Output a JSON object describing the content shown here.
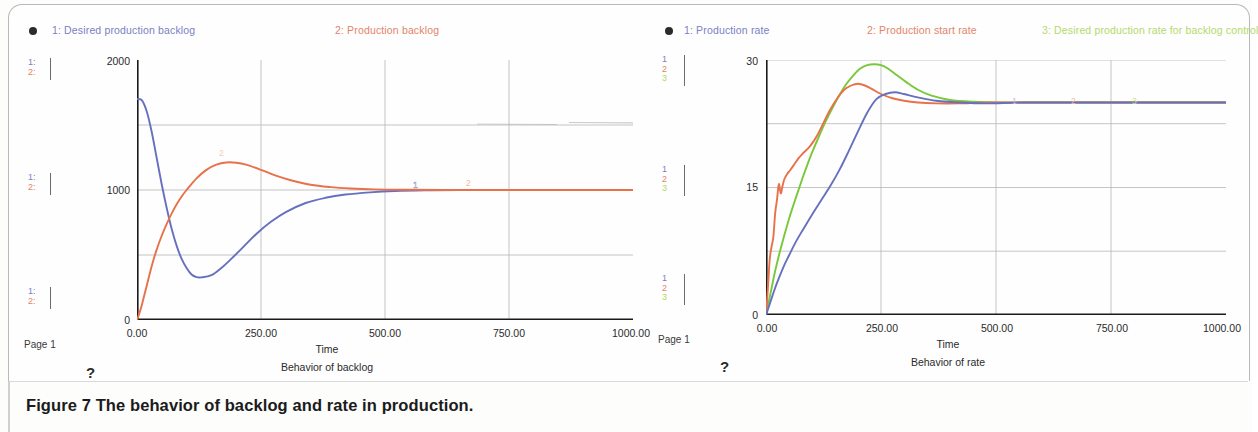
{
  "figure": {
    "caption": "Figure 7 The behavior of backlog and rate in production.",
    "page_label_left": "Page 1",
    "page_label_right": "Page 1",
    "help_glyph_left": "?",
    "help_glyph_right": "?"
  },
  "colors": {
    "series1_blue": "#6670c0",
    "series2_orange": "#e8714a",
    "series3_green": "#77c83a",
    "axis": "#1a1a1a",
    "grid": "#b6b6b6",
    "legend_blue": "#7b7fc4",
    "legend_orange": "#e2846a",
    "legend_green": "#b5d96a",
    "frame": "#b9b9b9"
  },
  "left_panel": {
    "legend": [
      {
        "id": "1",
        "label": "1: Desired production  backlog",
        "color_class": "lg-blue"
      },
      {
        "id": "2",
        "label": "2: Production backlog",
        "color_class": "lg-orange"
      }
    ],
    "scale_markers": [
      {
        "pos": "top",
        "rows": [
          "1:",
          "2:"
        ]
      },
      {
        "pos": "middle",
        "rows": [
          "1:",
          "2:"
        ]
      },
      {
        "pos": "bottom",
        "rows": [
          "1:",
          "2:"
        ]
      }
    ],
    "y_ticks": [
      "2000",
      "1000",
      "0"
    ],
    "x_ticks": [
      "0.00",
      "250.00",
      "500.00",
      "750.00",
      "1000.00"
    ],
    "x_axis_label": "Time",
    "title": "Behavior of backlog",
    "inline_labels": [
      "1",
      "2"
    ]
  },
  "right_panel": {
    "legend": [
      {
        "id": "1",
        "label": "1: Production rate",
        "color_class": "lg-blue"
      },
      {
        "id": "2",
        "label": "2: Production start rate",
        "color_class": "lg-orange"
      },
      {
        "id": "3",
        "label": "3: Desired production rate for backlog control",
        "color_class": "lg-green"
      }
    ],
    "scale_markers": [
      {
        "pos": "top",
        "rows": [
          "1",
          "2",
          "3"
        ]
      },
      {
        "pos": "middle",
        "rows": [
          "1",
          "2",
          "3"
        ]
      },
      {
        "pos": "bottom",
        "rows": [
          "1",
          "2",
          "3"
        ]
      }
    ],
    "y_ticks": [
      "30",
      "15",
      "0"
    ],
    "x_ticks": [
      "0.00",
      "250.00",
      "500.00",
      "750.00",
      "1000.00"
    ],
    "x_axis_label": "Time",
    "title": "Behavior of rate",
    "inline_labels": [
      "1",
      "2",
      "3"
    ]
  },
  "chart_data": [
    {
      "type": "line",
      "id": "behavior-of-backlog",
      "title": "Behavior of backlog",
      "xlabel": "Time",
      "ylabel": "",
      "xlim": [
        0,
        1000
      ],
      "ylim": [
        0,
        2000
      ],
      "xticks": [
        0,
        250,
        500,
        750,
        1000
      ],
      "yticks": [
        0,
        1000,
        2000
      ],
      "minor_yticks": [
        500,
        1500
      ],
      "grid": true,
      "legend_position": "top",
      "series": [
        {
          "name": "1: Desired production  backlog",
          "color": "#6670c0",
          "x": [
            0,
            10,
            20,
            30,
            40,
            50,
            60,
            70,
            80,
            90,
            100,
            110,
            120,
            130,
            150,
            170,
            190,
            210,
            240,
            270,
            300,
            340,
            380,
            420,
            470,
            520,
            580,
            650,
            750,
            850,
            1000
          ],
          "y": [
            1700,
            1690,
            1600,
            1440,
            1240,
            1040,
            860,
            700,
            570,
            470,
            400,
            350,
            330,
            328,
            345,
            400,
            470,
            545,
            660,
            755,
            830,
            900,
            940,
            965,
            982,
            992,
            997,
            999,
            1000,
            1000,
            1000
          ]
        },
        {
          "name": "2: Production backlog",
          "color": "#e8714a",
          "x": [
            0,
            5,
            10,
            20,
            30,
            40,
            50,
            60,
            70,
            80,
            90,
            100,
            120,
            140,
            160,
            180,
            200,
            220,
            250,
            280,
            310,
            350,
            390,
            430,
            480,
            540,
            620,
            720,
            850,
            1000
          ],
          "y": [
            0,
            55,
            120,
            270,
            420,
            545,
            650,
            740,
            820,
            890,
            950,
            1000,
            1090,
            1155,
            1195,
            1212,
            1210,
            1195,
            1155,
            1110,
            1075,
            1040,
            1022,
            1012,
            1005,
            1002,
            1000,
            1000,
            1000,
            1000
          ]
        }
      ]
    },
    {
      "type": "line",
      "id": "behavior-of-rate",
      "title": "Behavior of rate",
      "xlabel": "Time",
      "ylabel": "",
      "xlim": [
        0,
        1000
      ],
      "ylim": [
        0,
        30
      ],
      "xticks": [
        0,
        250,
        500,
        750,
        1000
      ],
      "yticks": [
        0,
        15,
        30
      ],
      "minor_yticks": [
        7.5,
        22.5
      ],
      "grid": true,
      "legend_position": "top",
      "series": [
        {
          "name": "1: Production rate",
          "color": "#6670c0",
          "x": [
            0,
            10,
            20,
            30,
            40,
            50,
            60,
            70,
            80,
            100,
            120,
            140,
            160,
            180,
            200,
            220,
            240,
            260,
            280,
            300,
            330,
            370,
            420,
            480,
            560,
            680,
            820,
            1000
          ],
          "y": [
            0,
            1.6,
            3.2,
            4.6,
            5.9,
            7.0,
            8.1,
            9.1,
            10.0,
            11.8,
            13.5,
            15.2,
            17.1,
            19.3,
            21.6,
            23.8,
            25.4,
            26.0,
            26.2,
            26.0,
            25.6,
            25.2,
            25.0,
            24.9,
            25.0,
            25.0,
            25.0,
            25.0
          ]
        },
        {
          "name": "2: Production start rate",
          "color": "#e8714a",
          "x": [
            0,
            4,
            8,
            12,
            16,
            20,
            24,
            28,
            32,
            36,
            40,
            46,
            52,
            60,
            70,
            80,
            95,
            110,
            125,
            140,
            155,
            170,
            185,
            200,
            215,
            230,
            250,
            275,
            300,
            330,
            370,
            420,
            490,
            600,
            1000
          ],
          "y": [
            0,
            3.0,
            6.5,
            8.0,
            9.2,
            12.0,
            13.6,
            15.4,
            14.3,
            15.2,
            16.0,
            16.6,
            17.0,
            17.6,
            18.4,
            19.0,
            19.8,
            21.0,
            22.6,
            24.2,
            25.5,
            26.5,
            27.0,
            27.2,
            27.0,
            26.6,
            26.0,
            25.5,
            25.2,
            25.0,
            24.9,
            24.9,
            25.0,
            25.0,
            25.0
          ]
        },
        {
          "name": "3: Desired production rate for backlog control",
          "color": "#77c83a",
          "x": [
            0,
            10,
            20,
            30,
            40,
            50,
            60,
            70,
            80,
            90,
            100,
            115,
            130,
            145,
            160,
            175,
            190,
            205,
            220,
            235,
            250,
            265,
            285,
            305,
            330,
            360,
            400,
            450,
            520,
            620,
            760,
            1000
          ],
          "y": [
            0,
            2.6,
            5.2,
            7.4,
            9.4,
            11.3,
            13.0,
            14.6,
            16.2,
            17.7,
            19.1,
            21.0,
            22.8,
            24.4,
            25.9,
            27.2,
            28.2,
            29.0,
            29.4,
            29.5,
            29.4,
            29.0,
            28.2,
            27.4,
            26.5,
            25.8,
            25.3,
            25.1,
            25.0,
            25.0,
            25.0,
            25.0
          ]
        }
      ]
    }
  ]
}
